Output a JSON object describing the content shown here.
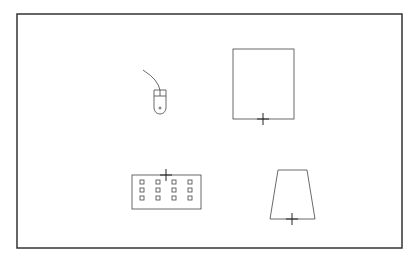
{
  "canvas": {
    "width": 415,
    "height": 261,
    "background": "#ffffff"
  },
  "frame": {
    "x": 17,
    "y": 14,
    "w": 385,
    "h": 234,
    "stroke": "#333333",
    "stroke_width": 1.5
  },
  "stroke_color": "#444444",
  "objects": [
    {
      "name": "mouse",
      "type": "computer-mouse",
      "x": 154,
      "y": 90,
      "w": 12,
      "h": 24,
      "marker": {
        "x": 160,
        "y": 108,
        "size": 3
      }
    },
    {
      "name": "tall-rectangle",
      "type": "rectangle",
      "x": 233,
      "y": 49,
      "w": 61,
      "h": 70,
      "marker": {
        "x": 263,
        "y": 119,
        "size": 6
      }
    },
    {
      "name": "keyboard",
      "type": "keyboard",
      "x": 132,
      "y": 175,
      "w": 69,
      "h": 34,
      "rows": 3,
      "cols": 4,
      "marker": {
        "x": 166,
        "y": 175,
        "size": 6
      }
    },
    {
      "name": "trapezoid",
      "type": "trapezoid",
      "points": [
        [
          278,
          170
        ],
        [
          307,
          170
        ],
        [
          315,
          219
        ],
        [
          270,
          219
        ]
      ],
      "marker": {
        "x": 292,
        "y": 219,
        "size": 6
      }
    }
  ]
}
